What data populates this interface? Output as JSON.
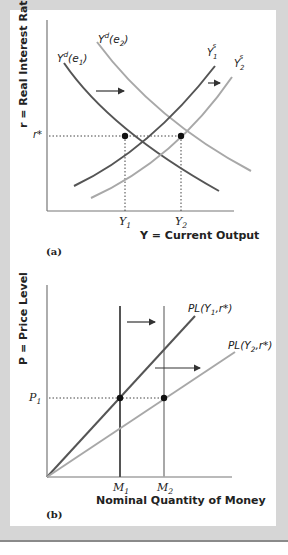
{
  "panel_a": {
    "tag": "(a)",
    "y_axis_label": "r = Real Interest Rate",
    "x_axis_label": "Y = Current Output",
    "r_star_label": "r*",
    "x_ticks": [
      "Y1",
      "Y2"
    ],
    "curves": [
      {
        "name": "Yd(e1)",
        "color": "#555555"
      },
      {
        "name": "Yd(e2)",
        "color": "#a8a8a8"
      },
      {
        "name": "Y1s",
        "color": "#555555"
      },
      {
        "name": "Y2s",
        "color": "#a8a8a8"
      }
    ]
  },
  "panel_b": {
    "tag": "(b)",
    "y_axis_label": "P = Price Level",
    "x_axis_label": "Nominal Quantity of Money",
    "p1_label": "P1",
    "x_ticks": [
      "M1",
      "M2"
    ],
    "lines": [
      {
        "name": "PL(Y1,r*)",
        "color": "#555555"
      },
      {
        "name": "PL(Y2,r*)",
        "color": "#a8a8a8"
      }
    ]
  },
  "colors": {
    "frame": "#d6d6d6",
    "dark_curve": "#555555",
    "light_curve": "#a8a8a8",
    "axis": "#777777"
  }
}
